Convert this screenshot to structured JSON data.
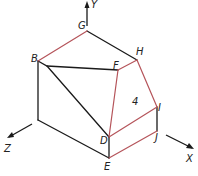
{
  "diagram": {
    "type": "isometric-pictorial-drawing",
    "colors": {
      "visible_edge": "#1a1a1a",
      "highlighted_edge": "#b5545a",
      "background": "#ffffff"
    },
    "vertex_labels": {
      "G": "G",
      "B": "B",
      "H": "H",
      "F": "F",
      "I": "I",
      "D": "D",
      "J": "J",
      "E": "E"
    },
    "surface_label": "4",
    "axes": {
      "x": "X",
      "y": "Y",
      "z": "Z"
    },
    "edges": [
      {
        "from": "B",
        "to": "G",
        "color": "red"
      },
      {
        "from": "G",
        "to": "H",
        "color": "black"
      },
      {
        "from": "F",
        "to": "H",
        "color": "red"
      },
      {
        "from": "H",
        "to": "I",
        "color": "red"
      },
      {
        "from": "F",
        "to": "D",
        "color": "red"
      },
      {
        "from": "D",
        "to": "I",
        "color": "red"
      },
      {
        "from": "E",
        "to": "J",
        "color": "red"
      },
      {
        "from": "I",
        "to": "J",
        "color": "black"
      },
      {
        "from": "D",
        "to": "E",
        "color": "black"
      },
      {
        "from": "B",
        "to": "F",
        "color": "black"
      },
      {
        "from": "B",
        "to": "D",
        "color": "black"
      }
    ]
  }
}
